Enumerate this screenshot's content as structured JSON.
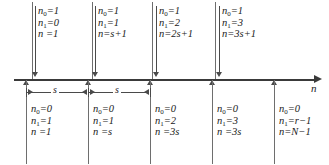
{
  "figure": {
    "axis": {
      "label": "n",
      "label_name": "n-axis-label"
    },
    "span_labels": [
      {
        "text": "s"
      },
      {
        "text": "s"
      }
    ],
    "top_blocks": [
      {
        "n0": "n<sub>0</sub>=1",
        "n1": "n<sub>1</sub>=0",
        "n": "n =1"
      },
      {
        "n0": "n<sub>0</sub>=1",
        "n1": "n<sub>1</sub>=1",
        "n": "n=s+1"
      },
      {
        "n0": "n<sub>0</sub>=1",
        "n1": "n<sub>1</sub>=2",
        "n": "n=2s+1"
      },
      {
        "n0": "n<sub>0</sub>=1",
        "n1": "n<sub>1</sub>=3",
        "n": "n=3s+1"
      }
    ],
    "bottom_blocks": [
      {
        "n0": "n<sub>0</sub>=0",
        "n1": "n<sub>1</sub>=1",
        "n": "n =1"
      },
      {
        "n0": "n<sub>0</sub>=0",
        "n1": "n<sub>1</sub>=1",
        "n": "n =s"
      },
      {
        "n0": "n<sub>0</sub>=0",
        "n1": "n<sub>1</sub>=2",
        "n": "n =3s"
      },
      {
        "n0": "n<sub>0</sub>=0",
        "n1": "n<sub>1</sub>=3",
        "n": "n =3s"
      },
      {
        "n0": "n<sub>0</sub>=0",
        "n1": "n<sub>1</sub>=r−1",
        "n": "n=N−1"
      }
    ],
    "colors": {
      "ink": "#1a1a1a",
      "rule": "#6e6e6e",
      "axis": "#3a3a3a",
      "background": "#ffffff"
    }
  }
}
